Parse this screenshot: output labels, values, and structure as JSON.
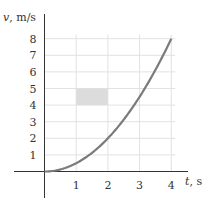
{
  "chart_data": {
    "type": "line",
    "title": "",
    "xlabel": "t, s",
    "ylabel": "v, m/s",
    "x_ticks": [
      "1",
      "2",
      "3",
      "4"
    ],
    "y_ticks": [
      "1",
      "2",
      "3",
      "4",
      "5",
      "6",
      "7",
      "8"
    ],
    "xlim": [
      0,
      4
    ],
    "ylim": [
      0,
      8
    ],
    "grid": true,
    "series": [
      {
        "name": "v(t)",
        "x": [
          0,
          0.5,
          1,
          1.5,
          2,
          2.5,
          3,
          3.5,
          4
        ],
        "values": [
          0,
          0.125,
          0.5,
          1.125,
          2,
          3.125,
          4.5,
          6.125,
          8
        ],
        "color": "#7a7a7a"
      }
    ],
    "annotations": [
      {
        "type": "shaded-rectangle",
        "x": [
          1,
          2
        ],
        "y": [
          4,
          5
        ],
        "color": "#dcdcdc"
      }
    ]
  },
  "labels": {
    "y_axis": "v, m/s",
    "x_axis": "t, s"
  }
}
